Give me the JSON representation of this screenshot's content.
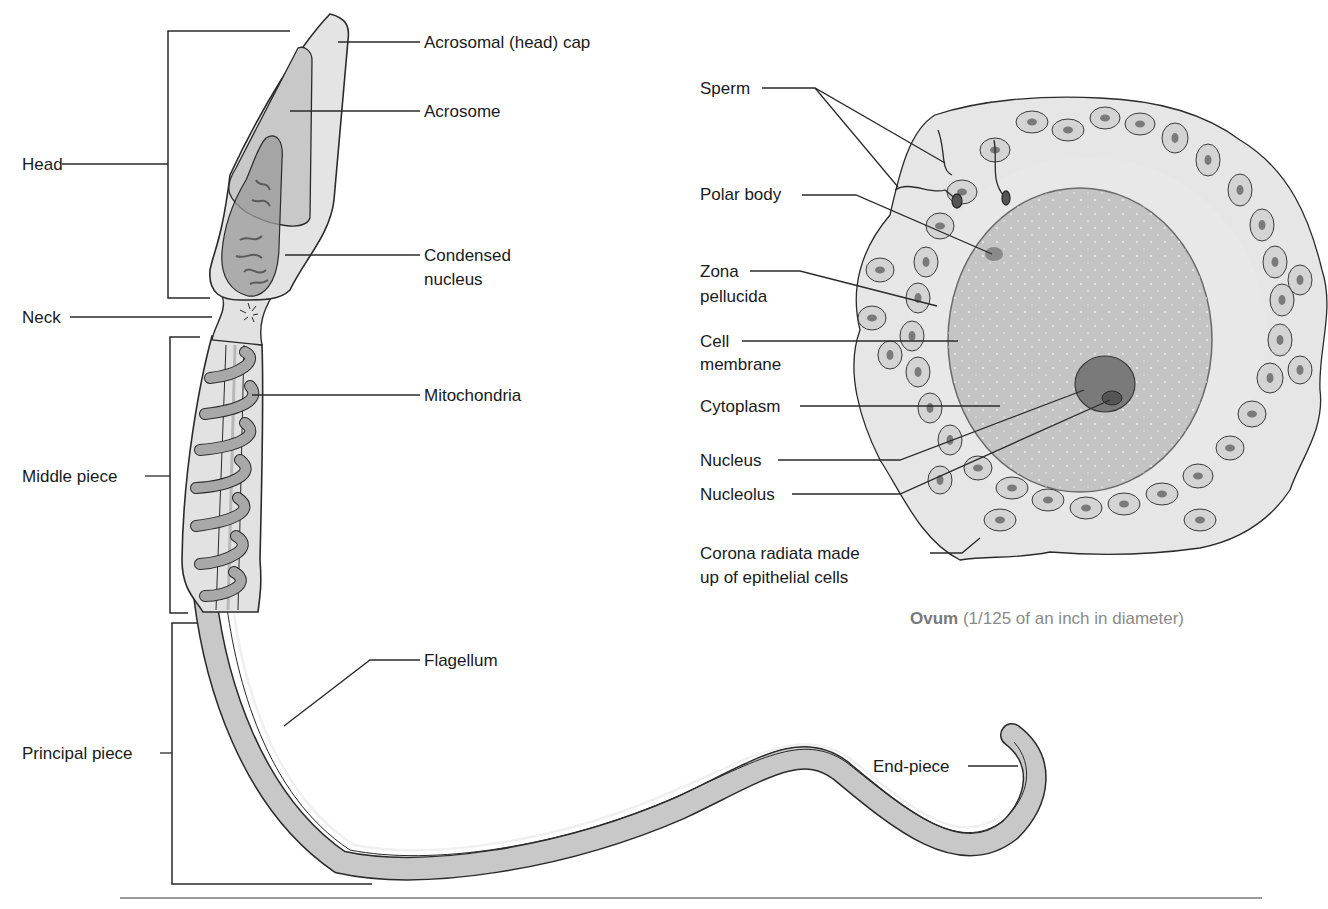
{
  "sperm": {
    "sections": {
      "head": "Head",
      "neck": "Neck",
      "middle_piece": "Middle piece",
      "principal_piece": "Principal piece"
    },
    "parts": {
      "acrosomal_cap": "Acrosomal (head) cap",
      "acrosome": "Acrosome",
      "condensed_nucleus_line1": "Condensed",
      "condensed_nucleus_line2": "nucleus",
      "mitochondria": "Mitochondria",
      "flagellum": "Flagellum",
      "end_piece": "End-piece"
    }
  },
  "ovum": {
    "labels": {
      "sperm": "Sperm",
      "polar_body": "Polar body",
      "zona_line1": "Zona",
      "zona_line2": "pellucida",
      "cell_membrane_line1": "Cell",
      "cell_membrane_line2": "membrane",
      "cytoplasm": "Cytoplasm",
      "nucleus": "Nucleus",
      "nucleolus": "Nucleolus",
      "corona_line1": "Corona radiata made",
      "corona_line2": "up of epithelial cells"
    },
    "caption_bold": "Ovum",
    "caption_rest": " (1/125 of an inch in diameter)"
  },
  "colors": {
    "outline": "#2a2a2a",
    "light_fill": "#e2e2e2",
    "mid_fill": "#c4c4c4",
    "dark_fill": "#8a8a8a",
    "caption": "#8a8a8a"
  }
}
